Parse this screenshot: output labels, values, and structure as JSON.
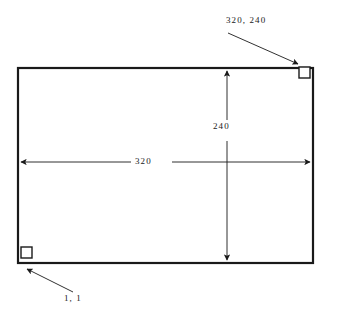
{
  "diagram": {
    "type": "line-drawing",
    "background_color": "#ffffff",
    "line_color": "#1a1a1a",
    "rectangle": {
      "x": 18,
      "y": 68,
      "width": 295,
      "height": 195,
      "stroke_width": 2
    },
    "corner_markers": [
      {
        "name": "bottom-left-corner-marker",
        "x": 21,
        "y": 246,
        "size": 11
      },
      {
        "name": "top-right-corner-marker",
        "x": 299,
        "y": 66,
        "size": 11
      }
    ],
    "labels": {
      "corner_max": "320, 240",
      "corner_min": "1, 1",
      "width": "320",
      "height": "240"
    },
    "dimension_lines": [
      {
        "name": "horizontal-dimension-line",
        "orientation": "horizontal",
        "value": "320",
        "from_x": 18,
        "to_x": 313,
        "y": 162
      },
      {
        "name": "vertical-dimension-line",
        "orientation": "vertical",
        "value": "240",
        "x": 227,
        "from_y": 68,
        "to_y": 263
      }
    ],
    "leader_lines": [
      {
        "name": "leader-line-top-right",
        "from_x": 228,
        "from_y": 33,
        "to_x": 299,
        "to_y": 65
      },
      {
        "name": "leader-line-bottom-left",
        "from_x": 73,
        "from_y": 292,
        "to_x": 26,
        "to_y": 268
      }
    ]
  }
}
